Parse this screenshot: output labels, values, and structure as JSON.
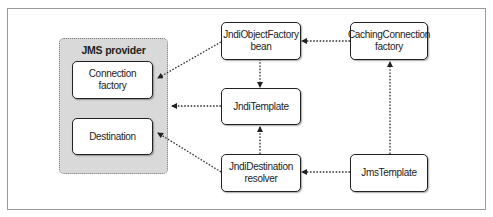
{
  "diagram": {
    "group": {
      "title": "JMS provider"
    },
    "nodes": {
      "connection_factory": {
        "line1": "Connection",
        "line2": "factory"
      },
      "destination": {
        "line1": "Destination"
      },
      "jndi_object_factory": {
        "line1": "JndiObjectFactory",
        "line2": "bean"
      },
      "jndi_template": {
        "line1": "JndiTemplate"
      },
      "jndi_destination_resolver": {
        "line1": "JndiDestination",
        "line2": "resolver"
      },
      "caching_connection_factory": {
        "line1": "CachingConnection",
        "line2": "factory"
      },
      "jms_template": {
        "line1": "JmsTemplate"
      }
    },
    "edges": [
      {
        "from": "JndiObjectFactory bean",
        "to": "Connection factory",
        "style": "dotted"
      },
      {
        "from": "JndiTemplate",
        "to": "JMS provider",
        "style": "dotted"
      },
      {
        "from": "JndiDestination resolver",
        "to": "Destination",
        "style": "dotted"
      },
      {
        "from": "JndiObjectFactory bean",
        "to": "JndiTemplate",
        "style": "dotted"
      },
      {
        "from": "JndiDestination resolver",
        "to": "JndiTemplate",
        "style": "dotted"
      },
      {
        "from": "CachingConnection factory",
        "to": "JndiObjectFactory bean",
        "style": "dotted"
      },
      {
        "from": "JmsTemplate",
        "to": "CachingConnection factory",
        "style": "dotted"
      },
      {
        "from": "JmsTemplate",
        "to": "JndiDestination resolver",
        "style": "dotted"
      }
    ],
    "colors": {
      "group_fill": "#d9d9d9",
      "node_border": "#222222",
      "edge": "#333333"
    }
  }
}
